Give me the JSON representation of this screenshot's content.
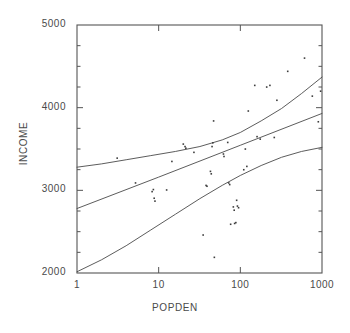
{
  "chart_data": {
    "type": "scatter",
    "title": "",
    "subtitle": "",
    "xlabel": "POPDEN",
    "ylabel": "INCOME",
    "xscale": "log",
    "yscale": "linear",
    "xlim": [
      1,
      1000
    ],
    "ylim": [
      2000,
      5000
    ],
    "grid": false,
    "legend": null,
    "xticks": [
      {
        "value": 1,
        "label": "1"
      },
      {
        "value": 10,
        "label": "10"
      },
      {
        "value": 100,
        "label": "100"
      },
      {
        "value": 1000,
        "label": "1000"
      }
    ],
    "yticks": [
      {
        "value": 2000,
        "label": "2000"
      },
      {
        "value": 3000,
        "label": "3000"
      },
      {
        "value": 4000,
        "label": "4000"
      },
      {
        "value": 5000,
        "label": "5000"
      }
    ],
    "yminorticks": [
      2250,
      2500,
      2750,
      3250,
      3500,
      3750,
      4250,
      4500,
      4750
    ],
    "marker": "small-dot",
    "points": [
      {
        "x": 3.1,
        "y": 3390
      },
      {
        "x": 5.2,
        "y": 3090
      },
      {
        "x": 8.3,
        "y": 2985
      },
      {
        "x": 8.6,
        "y": 3010
      },
      {
        "x": 8.8,
        "y": 2905
      },
      {
        "x": 9.0,
        "y": 2870
      },
      {
        "x": 12.5,
        "y": 3005
      },
      {
        "x": 14.5,
        "y": 3350
      },
      {
        "x": 20.0,
        "y": 3560
      },
      {
        "x": 21.0,
        "y": 3530
      },
      {
        "x": 21.5,
        "y": 3510
      },
      {
        "x": 27.0,
        "y": 3460
      },
      {
        "x": 35.0,
        "y": 2460
      },
      {
        "x": 38.0,
        "y": 3060
      },
      {
        "x": 39.0,
        "y": 3050
      },
      {
        "x": 43.0,
        "y": 3230
      },
      {
        "x": 44.0,
        "y": 3200
      },
      {
        "x": 45.0,
        "y": 3530
      },
      {
        "x": 46.0,
        "y": 3575
      },
      {
        "x": 47.0,
        "y": 3840
      },
      {
        "x": 48.0,
        "y": 2190
      },
      {
        "x": 62.0,
        "y": 3440
      },
      {
        "x": 63.0,
        "y": 3410
      },
      {
        "x": 70.0,
        "y": 3580
      },
      {
        "x": 72.0,
        "y": 3090
      },
      {
        "x": 74.0,
        "y": 3070
      },
      {
        "x": 76.0,
        "y": 2590
      },
      {
        "x": 82.0,
        "y": 2800
      },
      {
        "x": 84.0,
        "y": 2760
      },
      {
        "x": 85.0,
        "y": 2600
      },
      {
        "x": 88.0,
        "y": 2610
      },
      {
        "x": 90.0,
        "y": 2880
      },
      {
        "x": 92.0,
        "y": 2810
      },
      {
        "x": 95.0,
        "y": 2790
      },
      {
        "x": 110.0,
        "y": 3250
      },
      {
        "x": 115.0,
        "y": 3500
      },
      {
        "x": 120.0,
        "y": 3290
      },
      {
        "x": 125.0,
        "y": 3960
      },
      {
        "x": 150.0,
        "y": 4270
      },
      {
        "x": 160.0,
        "y": 3650
      },
      {
        "x": 175.0,
        "y": 3620
      },
      {
        "x": 210.0,
        "y": 4250
      },
      {
        "x": 230.0,
        "y": 4270
      },
      {
        "x": 260.0,
        "y": 3640
      },
      {
        "x": 280.0,
        "y": 4090
      },
      {
        "x": 380.0,
        "y": 4440
      },
      {
        "x": 610.0,
        "y": 4600
      },
      {
        "x": 760.0,
        "y": 4140
      },
      {
        "x": 900.0,
        "y": 3830
      },
      {
        "x": 960.0,
        "y": 4200
      }
    ],
    "curves": [
      {
        "name": "upper-confidence-band",
        "points": [
          {
            "x": 1,
            "y": 3280
          },
          {
            "x": 2,
            "y": 3320
          },
          {
            "x": 4,
            "y": 3370
          },
          {
            "x": 8,
            "y": 3420
          },
          {
            "x": 16,
            "y": 3470
          },
          {
            "x": 32,
            "y": 3530
          },
          {
            "x": 60,
            "y": 3610
          },
          {
            "x": 100,
            "y": 3700
          },
          {
            "x": 180,
            "y": 3840
          },
          {
            "x": 320,
            "y": 3990
          },
          {
            "x": 560,
            "y": 4170
          },
          {
            "x": 1000,
            "y": 4370
          }
        ]
      },
      {
        "name": "regression-fit-line",
        "points": [
          {
            "x": 1,
            "y": 2780
          },
          {
            "x": 10,
            "y": 3160
          },
          {
            "x": 100,
            "y": 3545
          },
          {
            "x": 1000,
            "y": 3930
          }
        ]
      },
      {
        "name": "lower-confidence-band",
        "points": [
          {
            "x": 1,
            "y": 2015
          },
          {
            "x": 2,
            "y": 2160
          },
          {
            "x": 4,
            "y": 2330
          },
          {
            "x": 8,
            "y": 2520
          },
          {
            "x": 16,
            "y": 2710
          },
          {
            "x": 32,
            "y": 2900
          },
          {
            "x": 60,
            "y": 3060
          },
          {
            "x": 100,
            "y": 3180
          },
          {
            "x": 180,
            "y": 3300
          },
          {
            "x": 320,
            "y": 3400
          },
          {
            "x": 560,
            "y": 3470
          },
          {
            "x": 1000,
            "y": 3520
          }
        ]
      }
    ]
  },
  "style": {
    "axis_color": "#555555",
    "line_color": "#4a4a4a",
    "point_color": "#3d3d3d",
    "background": "#ffffff"
  }
}
